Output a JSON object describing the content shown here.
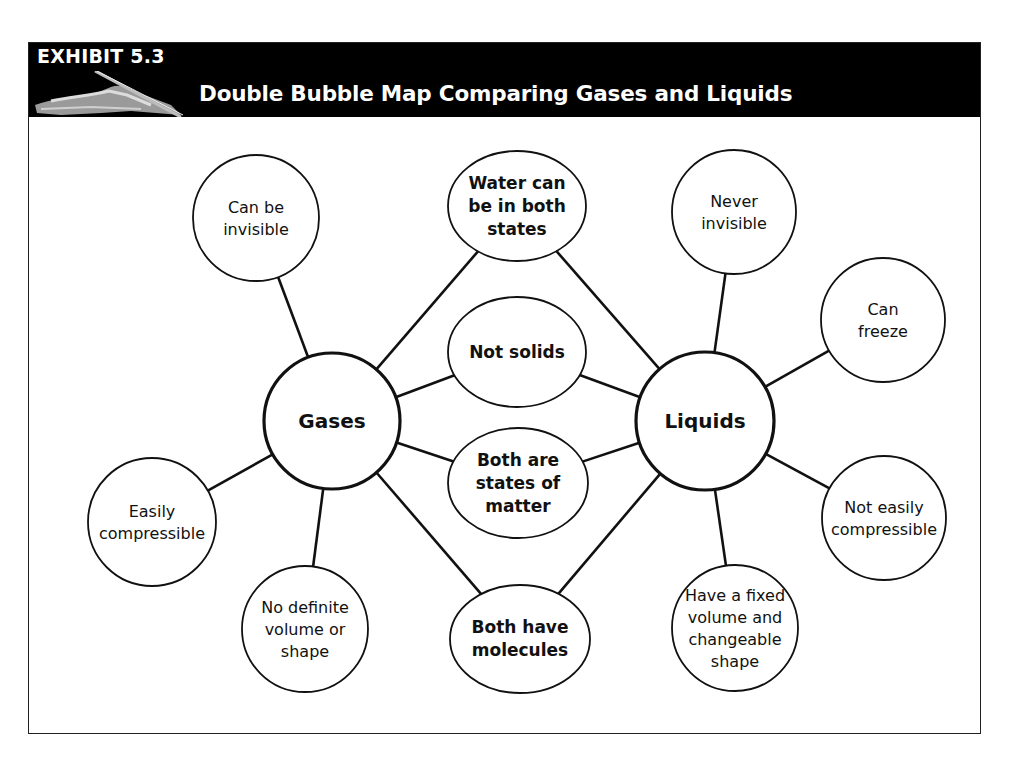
{
  "header": {
    "exhibit": "EXHIBIT 5.3",
    "title": "Double Bubble Map Comparing Gases and Liquids",
    "icon": "hand-writing-icon"
  },
  "diagram": {
    "type": "double-bubble-map",
    "hubs": {
      "left": {
        "label": "Gases",
        "cx": 332,
        "cy": 421,
        "r": 68
      },
      "right": {
        "label": "Liquids",
        "cx": 705,
        "cy": 421,
        "r": 69
      }
    },
    "shared": [
      {
        "lines": [
          "Water can",
          "be in both",
          "states"
        ],
        "cx": 517,
        "cy": 206,
        "rx": 69,
        "ry": 55
      },
      {
        "lines": [
          "Not solids"
        ],
        "cx": 517,
        "cy": 352,
        "rx": 69,
        "ry": 55
      },
      {
        "lines": [
          "Both are",
          "states of",
          "matter"
        ],
        "cx": 518,
        "cy": 483,
        "rx": 70,
        "ry": 55
      },
      {
        "lines": [
          "Both have",
          "molecules"
        ],
        "cx": 520,
        "cy": 639,
        "rx": 70,
        "ry": 54
      }
    ],
    "gases_only": [
      {
        "lines": [
          "Can be",
          "invisible"
        ],
        "cx": 256,
        "cy": 218,
        "r": 63
      },
      {
        "lines": [
          "Easily",
          "compressible"
        ],
        "cx": 152,
        "cy": 522,
        "r": 64
      },
      {
        "lines": [
          "No definite",
          "volume or",
          "shape"
        ],
        "cx": 305,
        "cy": 629,
        "r": 63
      }
    ],
    "liquids_only": [
      {
        "lines": [
          "Never",
          "invisible"
        ],
        "cx": 734,
        "cy": 212,
        "r": 62
      },
      {
        "lines": [
          "Can",
          "freeze"
        ],
        "cx": 883,
        "cy": 320,
        "r": 62
      },
      {
        "lines": [
          "Not easily",
          "compressible"
        ],
        "cx": 884,
        "cy": 518,
        "r": 62
      },
      {
        "lines": [
          "Have a fixed",
          "volume and",
          "changeable",
          "shape"
        ],
        "cx": 735,
        "cy": 628,
        "r": 63
      }
    ],
    "colors": {
      "stroke": "#111111",
      "header_bg": "#000000",
      "header_text": "#ffffff"
    }
  }
}
